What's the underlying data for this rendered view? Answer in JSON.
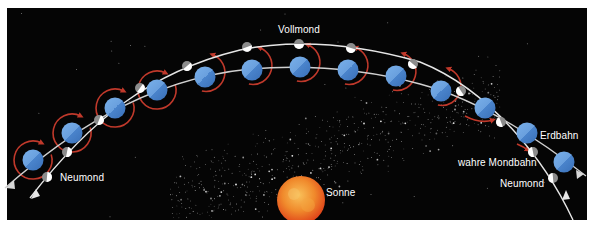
{
  "diagram": {
    "labels": {
      "full_moon": "Vollmond",
      "new_moon_left": "Neumond",
      "new_moon_right": "Neumond",
      "sun": "Sonne",
      "earth_orbit": "Erdbahn",
      "true_moon_orbit": "wahre Mondbahn"
    },
    "colors": {
      "background": "#050505",
      "frame": "#ffffff",
      "earth_light": "#6fa6e0",
      "earth_dark": "#3f78c2",
      "moon_lit": "#ffffff",
      "moon_shadow": "#8c8c8c",
      "moon_motion_arrow": "#c0392b",
      "orbit_line": "#d8d8d8",
      "sun_core": "#f5b041",
      "sun_edge": "#e8501e"
    },
    "earths": [
      {
        "x": 33,
        "y": 160,
        "ring": "full"
      },
      {
        "x": 72,
        "y": 133,
        "ring": "full"
      },
      {
        "x": 115,
        "y": 108,
        "ring": "full"
      },
      {
        "x": 157,
        "y": 90,
        "ring": "full"
      },
      {
        "x": 205,
        "y": 77,
        "ring": "partial"
      },
      {
        "x": 252,
        "y": 70,
        "ring": "partial"
      },
      {
        "x": 300,
        "y": 67,
        "ring": "partial"
      },
      {
        "x": 348,
        "y": 70,
        "ring": "partial"
      },
      {
        "x": 396,
        "y": 76,
        "ring": "partial"
      },
      {
        "x": 441,
        "y": 91,
        "ring": "partial"
      },
      {
        "x": 485,
        "y": 108,
        "ring": "small"
      },
      {
        "x": 527,
        "y": 133,
        "ring": "none"
      },
      {
        "x": 564,
        "y": 162,
        "ring": "none"
      }
    ],
    "moons": [
      {
        "x": 47,
        "y": 177
      },
      {
        "x": 67,
        "y": 152
      },
      {
        "x": 99,
        "y": 120
      },
      {
        "x": 140,
        "y": 88
      },
      {
        "x": 187,
        "y": 66
      },
      {
        "x": 247,
        "y": 47
      },
      {
        "x": 299,
        "y": 44
      },
      {
        "x": 351,
        "y": 48
      },
      {
        "x": 413,
        "y": 64
      },
      {
        "x": 461,
        "y": 91
      },
      {
        "x": 501,
        "y": 122
      },
      {
        "x": 533,
        "y": 152
      },
      {
        "x": 553,
        "y": 178
      }
    ],
    "sun": {
      "x": 301,
      "y": 200,
      "r": 24
    }
  }
}
